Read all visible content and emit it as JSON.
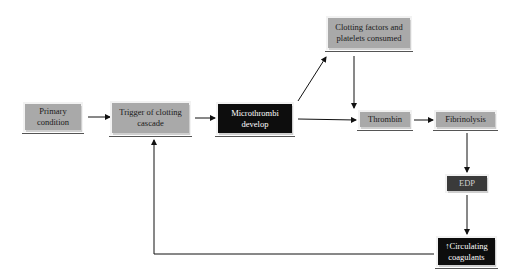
{
  "diagram": {
    "nodes": [
      {
        "id": "primary",
        "label": "Primary condition",
        "style": "gray"
      },
      {
        "id": "trigger",
        "label": "Trigger of clotting cascade",
        "style": "gray"
      },
      {
        "id": "micro",
        "label": "Microthrombi develop",
        "style": "black"
      },
      {
        "id": "clotting",
        "label": "Clotting factors and platelets consumed",
        "style": "gray"
      },
      {
        "id": "thrombin",
        "label": "Thrombin",
        "style": "gray"
      },
      {
        "id": "fibrin",
        "label": "Fibrinolysis",
        "style": "gray"
      },
      {
        "id": "edp",
        "label": "EDP",
        "style": "black"
      },
      {
        "id": "circ",
        "label": "↑Circulating coagulants",
        "style": "black"
      }
    ],
    "edges": [
      {
        "from": "primary",
        "to": "trigger"
      },
      {
        "from": "trigger",
        "to": "micro"
      },
      {
        "from": "micro",
        "to": "clotting"
      },
      {
        "from": "micro",
        "to": "thrombin"
      },
      {
        "from": "clotting",
        "to": "thrombin"
      },
      {
        "from": "thrombin",
        "to": "fibrin"
      },
      {
        "from": "fibrin",
        "to": "edp"
      },
      {
        "from": "edp",
        "to": "circ"
      },
      {
        "from": "circ",
        "to": "trigger"
      }
    ]
  }
}
